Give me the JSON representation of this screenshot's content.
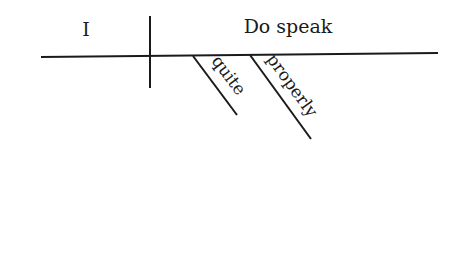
{
  "diagram": {
    "type": "sentence-diagram",
    "subject": "I",
    "predicate": "Do speak",
    "modifiers": [
      {
        "word": "quite"
      },
      {
        "word": "properly"
      }
    ],
    "line_color": "#1a1a1a"
  }
}
